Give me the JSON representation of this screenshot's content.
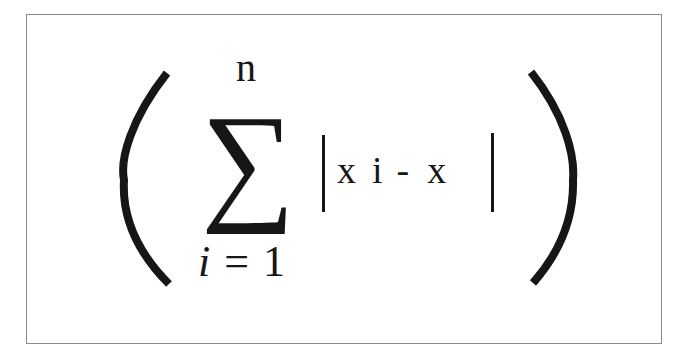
{
  "figure": {
    "type": "math-expression",
    "border_color": "#8a8a8a",
    "ink_color": "#161616",
    "background_color": "#ffffff"
  },
  "expression": {
    "open_paren": "(",
    "close_paren": ")",
    "operator": "∑",
    "upper_limit": "n",
    "lower_limit": {
      "variable": "i",
      "equals": "=",
      "start": "1"
    },
    "summand": {
      "abs_open": "|",
      "abs_close": "|",
      "term1": "x",
      "subscript": "i",
      "minus": "-",
      "term2": "x"
    },
    "plain_text": "( ∑_{i=1}^{n} | x i - x | )"
  }
}
